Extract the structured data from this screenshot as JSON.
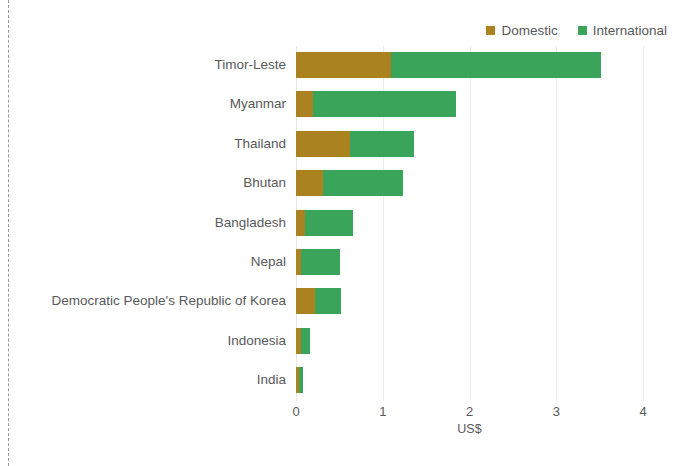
{
  "page": {
    "edge_rule": "dashed-vertical-rule"
  },
  "chart": {
    "title_fragment": "",
    "legend_position": "top-right"
  },
  "chart_data": {
    "type": "bar",
    "orientation": "horizontal",
    "stacked": true,
    "title": "",
    "xlabel": "US$",
    "ylabel": "",
    "xlim": [
      0,
      4
    ],
    "xticks": [
      "0",
      "1",
      "2",
      "3",
      "4"
    ],
    "grid": true,
    "legend": [
      "Domestic",
      "International"
    ],
    "colors": {
      "Domestic": "#ab8220",
      "International": "#3ba45b"
    },
    "categories": [
      "Timor-Leste",
      "Myanmar",
      "Thailand",
      "Bhutan",
      "Bangladesh",
      "Nepal",
      "Democratic People's Republic of Korea",
      "Indonesia",
      "India"
    ],
    "series": [
      {
        "name": "Domestic",
        "values": [
          1.1,
          0.2,
          0.62,
          0.31,
          0.1,
          0.06,
          0.22,
          0.06,
          0.04
        ]
      },
      {
        "name": "International",
        "values": [
          2.42,
          1.65,
          0.74,
          0.92,
          0.56,
          0.45,
          0.3,
          0.1,
          0.04
        ]
      }
    ],
    "totals": [
      3.52,
      1.85,
      1.36,
      1.23,
      0.66,
      0.51,
      0.52,
      0.16,
      0.08
    ]
  }
}
